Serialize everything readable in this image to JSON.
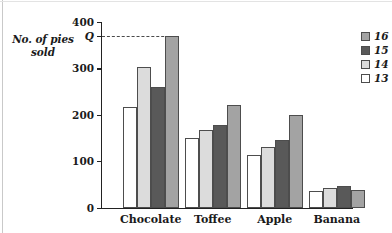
{
  "figure": {
    "y_axis_title": "No. of pies sold"
  },
  "chart_data": {
    "type": "bar",
    "title": "",
    "xlabel": "",
    "ylabel": "No. of pies sold",
    "ylim": [
      0,
      400
    ],
    "yticks": [
      0,
      100,
      200,
      300,
      400
    ],
    "ytick_labels": [
      "0",
      "100",
      "200",
      "300",
      "400"
    ],
    "grid": false,
    "legend_position": "right",
    "categories": [
      "Chocolate",
      "Toffee",
      "Apple",
      "Banana"
    ],
    "series": [
      {
        "name": "13",
        "color": "#ffffff",
        "values": [
          218,
          150,
          113,
          36
        ]
      },
      {
        "name": "14",
        "color": "#dcdcdc",
        "values": [
          303,
          168,
          131,
          42
        ]
      },
      {
        "name": "15",
        "color": "#595959",
        "values": [
          260,
          178,
          146,
          46
        ]
      },
      {
        "name": "16",
        "color": "#a3a3a3",
        "values": [
          370,
          222,
          199,
          38
        ]
      }
    ],
    "legend_entries": [
      {
        "label": "16",
        "color": "#a3a3a3"
      },
      {
        "label": "15",
        "color": "#595959"
      },
      {
        "label": "14",
        "color": "#dcdcdc"
      },
      {
        "label": "13",
        "color": "#ffffff"
      }
    ],
    "annotations": [
      {
        "name": "q-marker",
        "label": "Q",
        "value": 370,
        "style": "dashed-line-from-axis-to-bar",
        "target_series": "16",
        "target_category": "Chocolate"
      }
    ]
  }
}
